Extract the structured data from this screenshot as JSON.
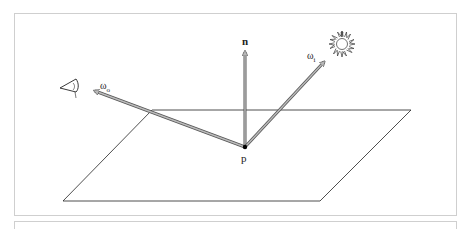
{
  "figure": {
    "labels": {
      "normal": "n",
      "incident": "ω",
      "incident_sub": "i",
      "outgoing": "ω",
      "outgoing_sub": "o",
      "point": "p"
    },
    "icons": {
      "light": "sun-icon",
      "viewer": "eye-icon"
    },
    "colors": {
      "line": "#222222",
      "arrow_fill": "#b8b8b8",
      "arrow_edge": "#555555",
      "frame": "#cfcfcf"
    }
  }
}
